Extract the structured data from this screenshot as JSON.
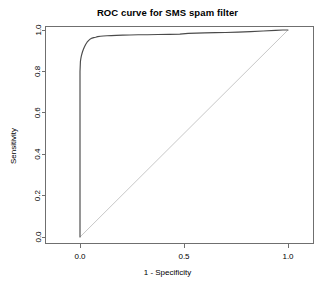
{
  "chart_data": {
    "type": "line",
    "title": "ROC curve for SMS spam filter",
    "xlabel": "1 - Specificity",
    "ylabel": "Sensitivity",
    "xlim": [
      0.0,
      1.0
    ],
    "ylim": [
      0.0,
      1.0
    ],
    "grid": false,
    "legend": "none",
    "xticks": [
      "0.0",
      "0.5",
      "1.0"
    ],
    "xtick_values": [
      0.0,
      0.5,
      1.0
    ],
    "yticks": [
      "0.0",
      "0.2",
      "0.4",
      "0.6",
      "0.8",
      "1.0"
    ],
    "ytick_values": [
      0.0,
      0.2,
      0.4,
      0.6,
      0.8,
      1.0
    ],
    "series": [
      {
        "name": "ROC curve",
        "color": "#4a4a4a",
        "x": [
          0.0,
          0.0,
          0.0,
          0.0,
          0.0,
          0.002,
          0.004,
          0.006,
          0.009,
          0.012,
          0.016,
          0.021,
          0.027,
          0.034,
          0.042,
          0.05,
          0.058,
          0.066,
          0.075,
          0.085,
          0.098,
          0.112,
          0.13,
          0.15,
          0.175,
          0.205,
          0.24,
          0.28,
          0.325,
          0.375,
          0.43,
          0.48,
          0.52,
          0.56,
          0.6,
          0.65,
          0.7,
          0.76,
          0.82,
          0.88,
          0.94,
          0.975,
          1.0
        ],
        "y": [
          0.0,
          0.2,
          0.45,
          0.65,
          0.8,
          0.848,
          0.862,
          0.873,
          0.884,
          0.895,
          0.906,
          0.918,
          0.93,
          0.941,
          0.95,
          0.957,
          0.961,
          0.963,
          0.965,
          0.968,
          0.97,
          0.971,
          0.972,
          0.973,
          0.974,
          0.975,
          0.976,
          0.977,
          0.977,
          0.978,
          0.979,
          0.98,
          0.984,
          0.985,
          0.986,
          0.987,
          0.988,
          0.99,
          0.992,
          0.995,
          0.998,
          1.0,
          1.0
        ]
      },
      {
        "name": "reference diagonal",
        "color": "#c8c8c8",
        "x": [
          0.0,
          1.0
        ],
        "y": [
          0.0,
          1.0
        ]
      }
    ]
  },
  "plot": {
    "title": "ROC curve for SMS spam filter",
    "xlabel": "1 - Specificity",
    "ylabel": "Sensitivity"
  }
}
